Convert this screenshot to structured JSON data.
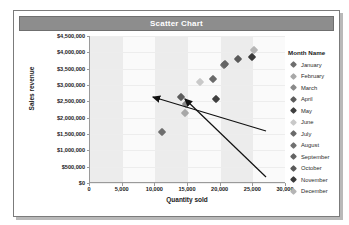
{
  "panel": {
    "title": "Scatter Chart"
  },
  "legend": {
    "title": "Month Name",
    "items": [
      {
        "label": "January",
        "color": "#6e6e6e"
      },
      {
        "label": "February",
        "color": "#a8a8a8"
      },
      {
        "label": "March",
        "color": "#8a8a8a"
      },
      {
        "label": "April",
        "color": "#5c5c5c"
      },
      {
        "label": "May",
        "color": "#3f3f3f"
      },
      {
        "label": "June",
        "color": "#c9c9c9"
      },
      {
        "label": "July",
        "color": "#6a6a6a"
      },
      {
        "label": "August",
        "color": "#707070"
      },
      {
        "label": "September",
        "color": "#646464"
      },
      {
        "label": "October",
        "color": "#5a5a5a"
      },
      {
        "label": "November",
        "color": "#3a3a3a"
      },
      {
        "label": "December",
        "color": "#b5b5b5"
      }
    ]
  },
  "annotations": [
    {
      "name": "arrow-to-july-point"
    },
    {
      "name": "arrow-to-november-point"
    }
  ],
  "chart_data": {
    "type": "scatter",
    "title": "Scatter Chart",
    "xlabel": "Quantity sold",
    "ylabel": "Sales revenue",
    "xlim": [
      0,
      30000
    ],
    "ylim": [
      0,
      4500000
    ],
    "xticks": [
      "0",
      "5,000",
      "10,000",
      "15,000",
      "20,000",
      "25,000",
      "30,000"
    ],
    "xtick_values": [
      0,
      5000,
      10000,
      15000,
      20000,
      25000,
      30000
    ],
    "yticks": [
      "$0",
      "$500,000",
      "$1,000,000",
      "$1,500,000",
      "$2,000,000",
      "$2,500,000",
      "$3,000,000",
      "$3,500,000",
      "$4,000,000",
      "$4,500,000"
    ],
    "ytick_values": [
      0,
      500000,
      1000000,
      1500000,
      2000000,
      2500000,
      3000000,
      3500000,
      4000000,
      4500000
    ],
    "grid": true,
    "legend_position": "right",
    "legend_title": "Month Name",
    "series_name": "Month Name",
    "points": [
      {
        "label": "January",
        "x": 11000,
        "y": 1560000,
        "color": "#6e6e6e"
      },
      {
        "label": "February",
        "x": 14600,
        "y": 2130000,
        "color": "#a8a8a8"
      },
      {
        "label": "March",
        "x": 14700,
        "y": 2410000,
        "color": "#8a8a8a"
      },
      {
        "label": "April",
        "x": 13900,
        "y": 2630000,
        "color": "#5c5c5c"
      },
      {
        "label": "May",
        "x": 19300,
        "y": 2580000,
        "color": "#3f3f3f"
      },
      {
        "label": "June",
        "x": 16800,
        "y": 3080000,
        "color": "#c9c9c9"
      },
      {
        "label": "July",
        "x": 18900,
        "y": 3190000,
        "color": "#6a6a6a"
      },
      {
        "label": "August",
        "x": 20500,
        "y": 3600000,
        "color": "#707070"
      },
      {
        "label": "September",
        "x": 20600,
        "y": 3640000,
        "color": "#646464"
      },
      {
        "label": "October",
        "x": 22600,
        "y": 3790000,
        "color": "#5a5a5a"
      },
      {
        "label": "November",
        "x": 24800,
        "y": 3860000,
        "color": "#3a3a3a"
      },
      {
        "label": "December",
        "x": 25100,
        "y": 4060000,
        "color": "#b5b5b5"
      }
    ]
  }
}
